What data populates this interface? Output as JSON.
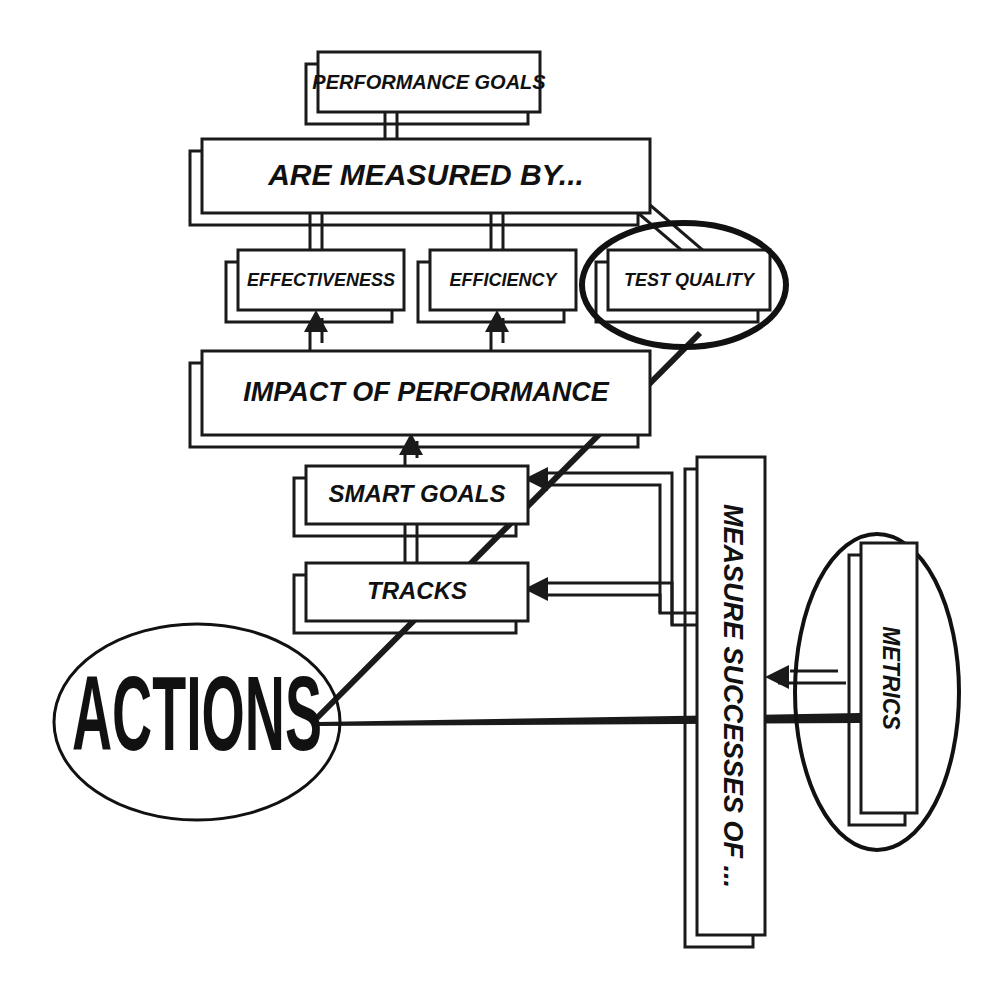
{
  "diagram": {
    "type": "flowchart",
    "background_color": "#ffffff",
    "line_color": "#1a1a1a",
    "nodes": [
      {
        "id": "performance-goals",
        "label": "PERFORMANCE GOALS",
        "shape": "box-with-shadow",
        "x": 318,
        "y": 52,
        "w": 222,
        "h": 60
      },
      {
        "id": "are-measured-by",
        "label": "ARE MEASURED BY...",
        "shape": "box-with-shadow",
        "x": 202,
        "y": 139,
        "w": 448,
        "h": 74
      },
      {
        "id": "effectiveness",
        "label": "EFFECTIVENESS",
        "shape": "box-with-shadow",
        "x": 238,
        "y": 250,
        "w": 166,
        "h": 60
      },
      {
        "id": "efficiency",
        "label": "EFFICIENCY",
        "shape": "box-with-shadow",
        "x": 430,
        "y": 250,
        "w": 146,
        "h": 60
      },
      {
        "id": "test-quality",
        "label": "TEST QUALITY",
        "shape": "box-with-shadow-in-ellipse",
        "x": 608,
        "y": 250,
        "w": 162,
        "h": 60
      },
      {
        "id": "impact-of-performance",
        "label": "IMPACT OF PERFORMANCE",
        "shape": "box-with-shadow",
        "x": 202,
        "y": 351,
        "w": 448,
        "h": 84
      },
      {
        "id": "smart-goals",
        "label": "SMART GOALS",
        "shape": "box-with-shadow",
        "x": 306,
        "y": 466,
        "w": 222,
        "h": 58
      },
      {
        "id": "tracks",
        "label": "TRACKS",
        "shape": "box-with-shadow",
        "x": 306,
        "y": 563,
        "w": 222,
        "h": 58
      },
      {
        "id": "measure-successes-of",
        "label": "MEASURE SUCCESSES OF ...",
        "shape": "box-with-shadow-rotated",
        "x": 697,
        "y": 457,
        "w": 68,
        "h": 478,
        "rotation": 90
      },
      {
        "id": "metrics",
        "label": "METRICS",
        "shape": "box-with-shadow-rotated-in-ellipse",
        "x": 849,
        "y": 555,
        "w": 56,
        "h": 270,
        "rotation": 90
      },
      {
        "id": "actions",
        "label": "ACTIONS",
        "shape": "ellipse",
        "cx": 197,
        "cy": 722,
        "rx": 143,
        "ry": 98
      }
    ],
    "edges": [
      {
        "from": "performance-goals",
        "to": "are-measured-by",
        "style": "double-line",
        "arrow": "none"
      },
      {
        "from": "are-measured-by",
        "to": "effectiveness",
        "style": "double-line",
        "arrow": "none"
      },
      {
        "from": "are-measured-by",
        "to": "efficiency",
        "style": "double-line",
        "arrow": "none"
      },
      {
        "from": "are-measured-by",
        "to": "test-quality",
        "style": "double-line",
        "arrow": "none"
      },
      {
        "from": "impact-of-performance",
        "to": "effectiveness",
        "style": "double-line",
        "arrow": "up"
      },
      {
        "from": "impact-of-performance",
        "to": "efficiency",
        "style": "double-line",
        "arrow": "up"
      },
      {
        "from": "smart-goals",
        "to": "impact-of-performance",
        "style": "double-line",
        "arrow": "up"
      },
      {
        "from": "smart-goals",
        "to": "tracks",
        "style": "double-line",
        "arrow": "none"
      },
      {
        "from": "measure-successes-of",
        "to": "smart-goals",
        "style": "double-line",
        "arrow": "left"
      },
      {
        "from": "measure-successes-of",
        "to": "tracks",
        "style": "double-line",
        "arrow": "left"
      },
      {
        "from": "metrics",
        "to": "measure-successes-of",
        "style": "double-line",
        "arrow": "left"
      },
      {
        "from": "actions",
        "to": "test-quality",
        "style": "thick-diagonal",
        "arrow": "none"
      },
      {
        "from": "actions",
        "to": "metrics",
        "style": "thin-taper",
        "arrow": "none"
      }
    ]
  },
  "labels": {
    "performance_goals": "PERFORMANCE GOALS",
    "are_measured_by": "ARE MEASURED BY...",
    "effectiveness": "EFFECTIVENESS",
    "efficiency": "EFFICIENCY",
    "test_quality": "TEST QUALITY",
    "impact_of_performance": "IMPACT OF PERFORMANCE",
    "smart_goals": "SMART GOALS",
    "tracks": "TRACKS",
    "measure_successes_of": "MEASURE SUCCESSES OF ...",
    "metrics": "METRICS",
    "actions": "ACTIONS"
  }
}
